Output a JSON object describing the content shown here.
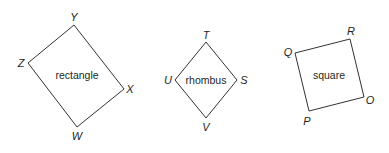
{
  "figures": [
    {
      "name": "rectangle",
      "vertices": [
        {
          "label": "Y",
          "x": 74,
          "y": 25,
          "lx": 74,
          "ly": 21
        },
        {
          "label": "X",
          "x": 124,
          "y": 89,
          "lx": 130,
          "ly": 93
        },
        {
          "label": "W",
          "x": 77,
          "y": 127,
          "lx": 77,
          "ly": 140
        },
        {
          "label": "Z",
          "x": 28,
          "y": 63,
          "lx": 21,
          "ly": 67
        }
      ],
      "center": {
        "x": 77,
        "y": 79
      }
    },
    {
      "name": "rhombus",
      "vertices": [
        {
          "label": "T",
          "x": 206,
          "y": 42,
          "lx": 206,
          "ly": 39
        },
        {
          "label": "S",
          "x": 237,
          "y": 80,
          "lx": 244,
          "ly": 84
        },
        {
          "label": "V",
          "x": 206,
          "y": 118,
          "lx": 206,
          "ly": 131
        },
        {
          "label": "U",
          "x": 175,
          "y": 80,
          "lx": 168,
          "ly": 84
        }
      ],
      "center": {
        "x": 206,
        "y": 84
      }
    },
    {
      "name": "square",
      "vertices": [
        {
          "label": "R",
          "x": 350,
          "y": 39,
          "lx": 351,
          "ly": 35
        },
        {
          "label": "O",
          "x": 364,
          "y": 97,
          "lx": 370,
          "ly": 104
        },
        {
          "label": "P",
          "x": 309,
          "y": 111,
          "lx": 307,
          "ly": 125
        },
        {
          "label": "Q",
          "x": 295,
          "y": 53,
          "lx": 288,
          "ly": 56
        }
      ],
      "center": {
        "x": 329,
        "y": 79
      }
    }
  ],
  "colors": {
    "stroke": "#333333",
    "text": "#231f20"
  }
}
